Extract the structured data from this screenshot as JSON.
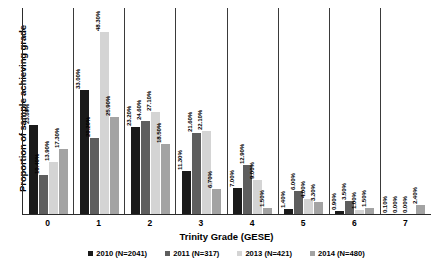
{
  "chart_data": {
    "type": "bar",
    "title": "",
    "xlabel": "Trinity Grade (GESE)",
    "ylabel": "Proportion of sample achieving grade",
    "categories": [
      "0",
      "1",
      "2",
      "3",
      "4",
      "5",
      "6",
      "7"
    ],
    "ylim": [
      0,
      55
    ],
    "grid": false,
    "legend_position": "bottom",
    "value_suffix": "%",
    "series": [
      {
        "name": "2010 (N=2041)",
        "color": "#1a1a1a",
        "values": [
          23.6,
          33.0,
          23.2,
          11.3,
          7.0,
          1.4,
          0.9,
          0.1
        ],
        "labels": [
          "23.60%",
          "33.00%",
          "23.20%",
          "11.30%",
          "7.00%",
          "1.40%",
          "0.90%",
          "0.10%"
        ]
      },
      {
        "name": "2011 (N=317)",
        "color": "#5e5e5e",
        "values": [
          10.4,
          20.2,
          24.6,
          21.6,
          12.9,
          6.0,
          3.5,
          0.0
        ],
        "labels": [
          "10.40%",
          "20.20%",
          "24.60%",
          "21.60%",
          "12.90%",
          "6.00%",
          "3.50%",
          "0.00%"
        ]
      },
      {
        "name": "2013 (N=421)",
        "color": "#d4d4d4",
        "values": [
          13.9,
          48.3,
          27.1,
          22.1,
          9.0,
          4.0,
          1.0,
          0.0
        ],
        "labels": [
          "13.90%",
          "48.30%",
          "27.10%",
          "22.10%",
          "9.00%",
          "4.00%",
          "1.00%",
          "0.00%"
        ]
      },
      {
        "name": "2014 (N=480)",
        "color": "#a3a3a3",
        "values": [
          17.3,
          25.9,
          18.5,
          6.7,
          1.5,
          3.3,
          1.5,
          2.4
        ],
        "labels": [
          "17.30%",
          "25.90%",
          "18.50%",
          "6.70%",
          "1.50%",
          "3.30%",
          "1.50%",
          "2.40%"
        ]
      }
    ]
  }
}
